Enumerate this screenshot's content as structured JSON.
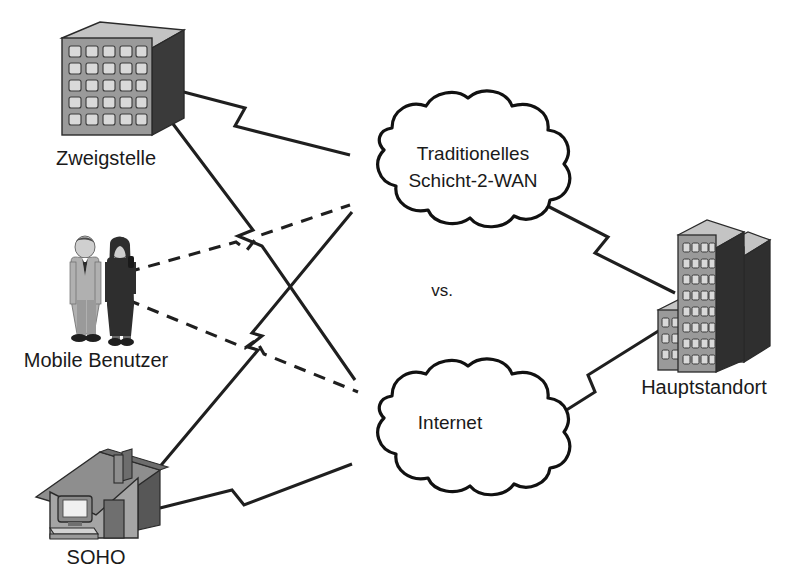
{
  "diagram": {
    "center_text": "vs.",
    "background_color": "#ffffff",
    "line_color": "#1f1f1f",
    "nodes": {
      "branch_office": {
        "label": "Zweigstelle",
        "icon": "office-building-icon",
        "window_rows": 5,
        "window_cols": 5
      },
      "mobile_users": {
        "label": "Mobile Benutzer",
        "icon": "two-people-icon"
      },
      "soho": {
        "label": "SOHO",
        "icon": "house-with-computer-icon"
      },
      "headquarters": {
        "label": "Hauptstandort",
        "icon": "office-building-cluster-icon"
      },
      "legacy_wan_cloud": {
        "label_line1": "Traditionelles",
        "label_line2": "Schicht-2-WAN",
        "icon": "cloud-icon"
      },
      "internet_cloud": {
        "label": "Internet",
        "icon": "cloud-icon"
      }
    },
    "links": [
      {
        "from": "Zweigstelle",
        "to": "Traditionelles Schicht-2-WAN",
        "style": "solid-lightning"
      },
      {
        "from": "Zweigstelle",
        "to": "Internet",
        "style": "solid-lightning"
      },
      {
        "from": "SOHO",
        "to": "Traditionelles Schicht-2-WAN",
        "style": "solid-lightning"
      },
      {
        "from": "SOHO",
        "to": "Internet",
        "style": "solid-lightning"
      },
      {
        "from": "Mobile Benutzer",
        "to": "Traditionelles Schicht-2-WAN",
        "style": "dashed-lightning"
      },
      {
        "from": "Mobile Benutzer",
        "to": "Internet",
        "style": "dashed-lightning"
      },
      {
        "from": "Traditionelles Schicht-2-WAN",
        "to": "Hauptstandort",
        "style": "solid-lightning"
      },
      {
        "from": "Internet",
        "to": "Hauptstandort",
        "style": "solid-lightning"
      }
    ],
    "colors": {
      "building_front": "#9a9a9a",
      "building_side": "#3a3a3a",
      "building_top": "#c4c4c4",
      "window": "#d8d8d8",
      "roof": "#8e8e8e",
      "wall": "#a5a5a5",
      "suit_light": "#b0b0b0",
      "suit_dark": "#2e2e2e"
    }
  }
}
